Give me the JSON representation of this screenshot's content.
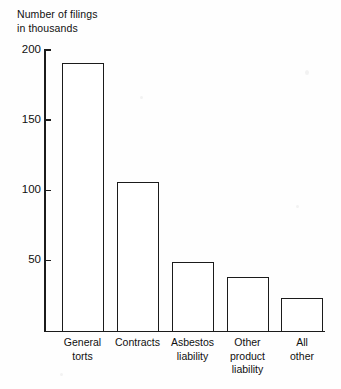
{
  "chart_data": {
    "type": "bar",
    "title_line1": "Number of filings",
    "title_line2": "in thousands",
    "xlabel": "",
    "ylabel": "Number of filings in thousands",
    "categories": [
      "General torts",
      "Contracts",
      "Asbestos liability",
      "Other product liability",
      "All other"
    ],
    "category_lines": [
      [
        "General",
        "torts"
      ],
      [
        "Contracts"
      ],
      [
        "Asbestos",
        "liability"
      ],
      [
        "Other",
        "product",
        "liability"
      ],
      [
        "All",
        "other"
      ]
    ],
    "values": [
      191,
      106,
      49,
      38,
      23
    ],
    "ylim": [
      0,
      200
    ],
    "yticks": [
      50,
      100,
      150,
      200
    ],
    "ytick_labels": [
      "50",
      "100",
      "150",
      "200"
    ],
    "grid": false,
    "legend": false,
    "bar_facecolor": "#ffffff",
    "bar_edgecolor": "#1b1b1b",
    "axis_color": "#1b1b1b",
    "background": "#fefefe"
  }
}
